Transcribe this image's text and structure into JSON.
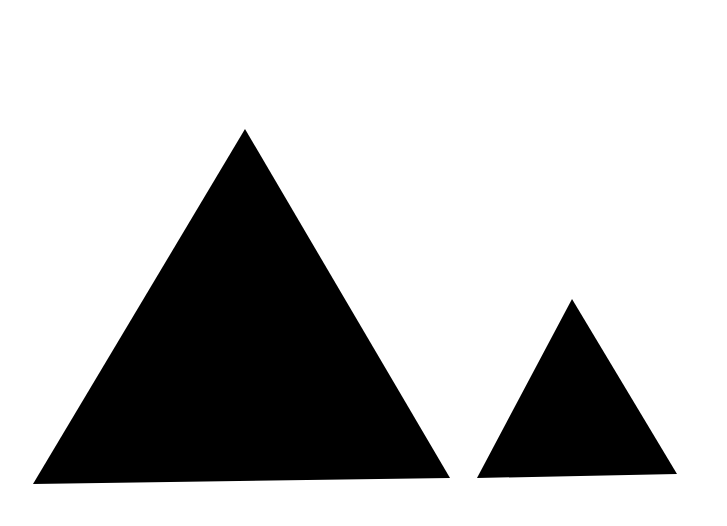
{
  "scene": {
    "background": "#ffffff",
    "shapes": [
      {
        "name": "large-triangle",
        "type": "triangle",
        "fill": "#000000",
        "points": "245,129 33,484 450,478"
      },
      {
        "name": "small-triangle",
        "type": "triangle",
        "fill": "#000000",
        "points": "572,299 477,478 677,474"
      }
    ]
  }
}
